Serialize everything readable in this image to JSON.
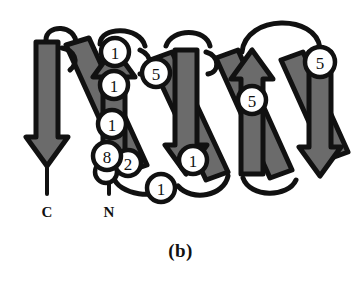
{
  "figure": {
    "caption": "(b)",
    "type": "protein-topology-diagram",
    "colors": {
      "strand_fill": "#6b6b6b",
      "outline": "#111111",
      "node_fill": "#ffffff",
      "background": "#ffffff"
    },
    "terminals": [
      {
        "id": "c-terminus",
        "label": "C",
        "x": 47,
        "y": 206
      },
      {
        "id": "n-terminus",
        "label": "N",
        "x": 109,
        "y": 206
      }
    ],
    "nodes": [
      {
        "id": "node-1",
        "label": "1",
        "cx": 115,
        "cy": 52,
        "r": 14
      },
      {
        "id": "node-2",
        "label": "1",
        "cx": 114,
        "cy": 85,
        "r": 14
      },
      {
        "id": "node-3",
        "label": "5",
        "cx": 156,
        "cy": 73,
        "r": 14
      },
      {
        "id": "node-4",
        "label": "1",
        "cx": 112,
        "cy": 124,
        "r": 14
      },
      {
        "id": "node-5",
        "label": "8",
        "cx": 107,
        "cy": 156,
        "r": 14
      },
      {
        "id": "node-6",
        "label": "2",
        "cx": 128,
        "cy": 163,
        "r": 13
      },
      {
        "id": "node-7",
        "label": "1",
        "cx": 161,
        "cy": 188,
        "r": 14
      },
      {
        "id": "node-8",
        "label": "1",
        "cx": 193,
        "cy": 160,
        "r": 14
      },
      {
        "id": "node-9",
        "label": "5",
        "cx": 252,
        "cy": 100,
        "r": 14
      },
      {
        "id": "node-10",
        "label": "5",
        "cx": 320,
        "cy": 62,
        "r": 15
      }
    ],
    "strand_count": 8,
    "motif_count": 4
  }
}
